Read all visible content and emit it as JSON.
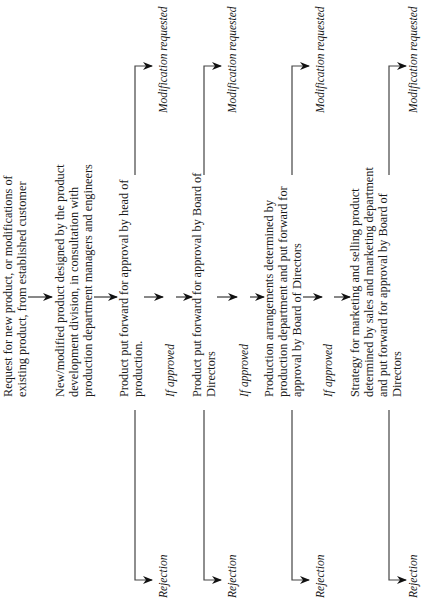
{
  "diagram": {
    "orientation": "rotated-90-ccw",
    "steps": [
      {
        "lines": [
          "Request for new product, or modifications of",
          "existing product, from established customer"
        ]
      },
      {
        "lines": [
          "New/modified product designed by the product",
          "development division, in consultation with",
          "production department managers and engineers"
        ]
      },
      {
        "lines": [
          "Product put forward for approval by head of",
          "production."
        ]
      },
      {
        "lines": [
          "Product put forward for approval by Board of",
          "Directors"
        ]
      },
      {
        "lines": [
          "Production arrangements determined by",
          "production department and put forward for",
          "approval by Board of Directors"
        ]
      },
      {
        "lines": [
          "Strategy for marketing and selling product",
          "determined by sales and marketing department",
          "and put forward for approval by Board of",
          "Directors"
        ]
      }
    ],
    "conditions": [
      "If approved",
      "If approved",
      "If approved"
    ],
    "branches": [
      {
        "modification_label": "Modification requested",
        "rejection_label": "Rejection"
      },
      {
        "modification_label": "Modification requested",
        "rejection_label": "Rejection"
      },
      {
        "modification_label": "Modification requested",
        "rejection_label": "Rejection"
      },
      {
        "modification_label": "Modification requested",
        "rejection_label": "Rejection"
      }
    ],
    "colors": {
      "line": "#444444",
      "arrow": "#111111",
      "text": "#1a1a1a",
      "background": "#ffffff"
    }
  }
}
